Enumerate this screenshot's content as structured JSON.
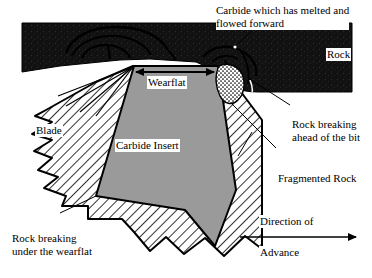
{
  "figure": {
    "width": 372,
    "height": 278
  },
  "labels": {
    "carbide_melted": "Carbide which has melted and\nflowed forward",
    "rock": "Rock",
    "wearflat": "Wearflat",
    "carbide_insert": "Carbide Insert",
    "blade": "Blade",
    "rock_breaking_ahead": "Rock breaking\nahead of the bit",
    "fragmented_rock": "Fragmented Rock",
    "rock_breaking_under": "Rock breaking\nunder the wearflat",
    "direction_of": "Direction of",
    "advance": "Advance"
  },
  "colors": {
    "rock_mass": "#111111",
    "carbide_insert": "#9a9a9a",
    "blade_fill": "#ffffff",
    "hatch_stroke": "#000000",
    "fragmented_rock_fill": "#ffffff",
    "outline": "#000000",
    "background": "#ffffff"
  },
  "geometry": {
    "rock_mass_note": "dark rectangular mass across top with notched lower boundary at the bit",
    "wearflat_arrow": "double-headed horizontal arrow spanning the wearflat width",
    "advance_arrow": "single-headed horizontal arrow pointing right",
    "leader_lines": [
      "carbide-melted-label to melt lobe on rock surface",
      "rock-breaking-ahead-label to crack ahead of bit",
      "fragmented-rock-label to stippled debris zone",
      "rock-breaking-under-label to fracture beneath wearflat"
    ]
  }
}
